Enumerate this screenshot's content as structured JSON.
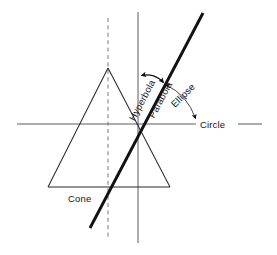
{
  "figure": {
    "background_color": "#ffffff",
    "line_color": "#222222",
    "thick_line_color": "#111111",
    "text_color": "#141414",
    "width": 277,
    "height": 255
  },
  "labels": {
    "hyperbola": "Hyperbola",
    "parabola": "Parabola",
    "ellipse": "Ellipse",
    "circle": "Circle",
    "cone": "Cone"
  },
  "geometry": {
    "center": {
      "x": 138,
      "y": 124
    },
    "apex": {
      "x": 108,
      "y": 68
    },
    "base_left": {
      "x": 48,
      "y": 187
    },
    "base_right": {
      "x": 170,
      "y": 187
    },
    "axis_vertical": {
      "x": 138,
      "y1": 12,
      "y2": 243
    },
    "axis_horizontal": {
      "y": 124,
      "x1": 17,
      "x2": 262
    },
    "dashed_axis": {
      "x": 108,
      "y1": 18,
      "y2": 238
    },
    "cutting_plane": {
      "x1": 90,
      "y1": 228,
      "x2": 203,
      "y2": 13
    }
  },
  "annotations": {
    "hyperbola_rotation_deg": -62,
    "parabola_rotation_deg": -62,
    "ellipse_rotation_deg": -45,
    "circle_rotation_deg": 0,
    "cone_rotation_deg": 0
  }
}
